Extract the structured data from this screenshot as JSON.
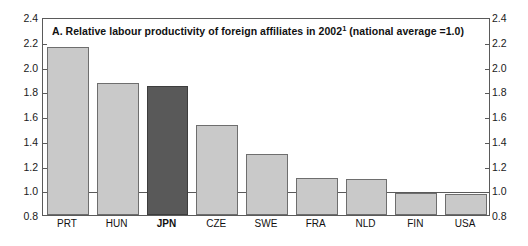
{
  "chart_data": {
    "type": "bar",
    "title": "A. Relative labour productivity of foreign affiliates in 2002",
    "title_superscript": "1",
    "title_suffix": " (national average =1.0)",
    "xlabel": "",
    "ylabel": "",
    "categories": [
      "PRT",
      "HUN",
      "JPN",
      "CZE",
      "SWE",
      "FRA",
      "NLD",
      "FIN",
      "USA"
    ],
    "values": [
      2.16,
      1.87,
      1.84,
      1.53,
      1.29,
      1.1,
      1.09,
      0.98,
      0.97
    ],
    "highlight_category": "JPN",
    "ylim": [
      0.8,
      2.4
    ],
    "ytick_labels": [
      "2.4",
      "2.2",
      "2.0",
      "1.8",
      "1.6",
      "1.4",
      "1.2",
      "1.0",
      "0.8"
    ],
    "ytick_values": [
      2.4,
      2.2,
      2.0,
      1.8,
      1.6,
      1.4,
      1.2,
      1.0,
      0.8
    ],
    "reference_line": 1.0,
    "grid": false,
    "legend_position": "none",
    "right_axis_labels": [
      "2.4",
      "2.2",
      "2.0",
      "1.8",
      "1.6",
      "1.4",
      "1.2",
      "1.0",
      "0.8"
    ],
    "colors": {
      "bar": "#c9c9c9",
      "bar_highlight": "#595959",
      "bar_border": "#6e6e6e",
      "axis": "#5a5a5a",
      "text": "#111111"
    }
  }
}
